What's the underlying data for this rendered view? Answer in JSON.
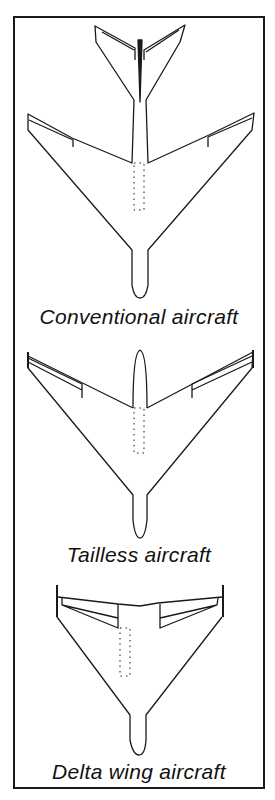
{
  "figure": {
    "panels": [
      {
        "id": "conventional",
        "caption": "Conventional aircraft"
      },
      {
        "id": "tailless",
        "caption": "Tailless aircraft"
      },
      {
        "id": "delta",
        "caption": "Delta wing aircraft"
      }
    ],
    "colors": {
      "line": "#1a1a1a",
      "background": "#ffffff"
    }
  }
}
